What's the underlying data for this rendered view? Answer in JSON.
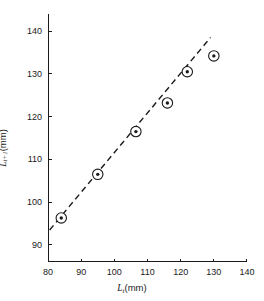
{
  "chart_data": {
    "type": "scatter",
    "title": "",
    "xlabel": "L_t (mm)",
    "ylabel": "L_t+1 (mm)",
    "xlim": [
      80,
      140
    ],
    "ylim": [
      86,
      144
    ],
    "xticks": [
      80,
      90,
      100,
      110,
      120,
      130,
      140
    ],
    "yticks": [
      90,
      100,
      110,
      120,
      130,
      140
    ],
    "xtick_labels": [
      "80",
      "90",
      "100",
      "110",
      "120",
      "130",
      "140"
    ],
    "ytick_labels": [
      "90",
      "100",
      "110",
      "120",
      "130",
      "140"
    ],
    "grid": false,
    "legend": false,
    "marker": "circle-with-center-dot",
    "x": [
      84,
      95,
      106.5,
      116,
      122,
      130
    ],
    "y": [
      96.3,
      106.5,
      116.5,
      123.2,
      130.5,
      134.2
    ],
    "points": [
      {
        "x": 84,
        "y": 96.3
      },
      {
        "x": 95,
        "y": 106.5
      },
      {
        "x": 106.5,
        "y": 116.5
      },
      {
        "x": 116,
        "y": 123.2
      },
      {
        "x": 122,
        "y": 130.5
      },
      {
        "x": 130,
        "y": 134.2
      }
    ],
    "fit_line": {
      "style": "dashed",
      "x": [
        80.5,
        129
      ],
      "y": [
        93.5,
        138.5
      ]
    }
  },
  "axes": {
    "x_title_var": "L",
    "x_title_sub": "t",
    "x_title_unit": "(mm)",
    "y_title_var": "L",
    "y_title_sub": "t+1",
    "y_title_unit": "(mm)"
  },
  "style": {
    "axis_color": "#1a1a1a",
    "marker_edge_color": "#1a1a1a",
    "marker_face_color": "#ffffff",
    "marker_dot_color": "#1a1a1a",
    "line_color": "#1a1a1a",
    "background": "#ffffff"
  }
}
